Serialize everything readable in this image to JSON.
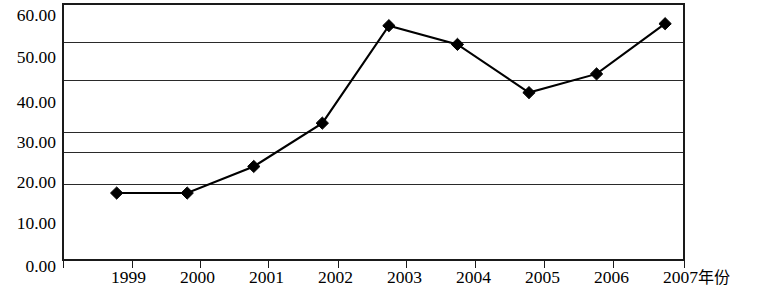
{
  "chart_data": {
    "type": "line",
    "title": "",
    "subtitle": "",
    "xlabel": "年份",
    "ylabel": "",
    "x": [
      "1999",
      "2000",
      "2001",
      "2002",
      "2003",
      "2004",
      "2005",
      "2006",
      "2007"
    ],
    "categories": [
      "1999",
      "2000",
      "2001",
      "2002",
      "2003",
      "2004",
      "2005",
      "2006",
      "2007"
    ],
    "values": [
      18.0,
      18.0,
      24.5,
      34.0,
      57.0,
      52.0,
      41.0,
      46.0,
      58.0
    ],
    "series": [
      {
        "name": "",
        "values": [
          18.0,
          18.0,
          24.5,
          34.0,
          57.0,
          52.0,
          41.0,
          46.0,
          58.0
        ]
      }
    ],
    "point_positions_px": [
      {
        "x": 115,
        "y": 194
      },
      {
        "x": 186,
        "y": 194
      },
      {
        "x": 253,
        "y": 167
      },
      {
        "x": 322,
        "y": 123
      },
      {
        "x": 389,
        "y": 24
      },
      {
        "x": 458,
        "y": 43
      },
      {
        "x": 530,
        "y": 92
      },
      {
        "x": 598,
        "y": 73
      },
      {
        "x": 667,
        "y": 22
      }
    ],
    "ylim": [
      0.0,
      60.0
    ],
    "ytick_labels": [
      "60.00",
      "50.00",
      "40.00",
      "30.00",
      "20.00",
      "10.00",
      "0.00"
    ],
    "ytick_values": [
      60.0,
      50.0,
      40.0,
      30.0,
      20.0,
      10.0,
      0.0
    ],
    "xtick_labels": [
      "1999",
      "2000",
      "2001",
      "2002",
      "2003",
      "2004",
      "2005",
      "2006",
      "2007"
    ],
    "grid": true,
    "gridline_count": 6,
    "legend": [],
    "legend_position": "none",
    "marker": "diamond",
    "line_color": "#000000",
    "marker_color": "#000000",
    "grid_color": "#2a2a2a",
    "axis_color": "#1a1a1a",
    "background_color": "#ffffff",
    "annotations": []
  },
  "axes": {
    "y_labels": [
      {
        "text": "60.00",
        "top": 7
      },
      {
        "text": "50.00",
        "top": 49
      },
      {
        "text": "40.00",
        "top": 94
      },
      {
        "text": "30.00",
        "top": 134
      },
      {
        "text": "20.00",
        "top": 174
      },
      {
        "text": "10.00",
        "top": 215
      },
      {
        "text": "0.00",
        "top": 258
      }
    ],
    "gridlines_top": [
      37,
      75,
      127,
      147,
      179
    ],
    "x_ticks_left": [
      63,
      132,
      200,
      268,
      338,
      406,
      475,
      544,
      613,
      684
    ],
    "x_labels": [
      {
        "text": "1999",
        "left": 111
      },
      {
        "text": "2000",
        "left": 180
      },
      {
        "text": "2001",
        "left": 249
      },
      {
        "text": "2002",
        "left": 318
      },
      {
        "text": "2003",
        "left": 387
      },
      {
        "text": "2004",
        "left": 456
      },
      {
        "text": "2005",
        "left": 525
      },
      {
        "text": "2006",
        "left": 594
      },
      {
        "text": "2007",
        "left": 663
      }
    ],
    "x_unit_label": "年份"
  }
}
